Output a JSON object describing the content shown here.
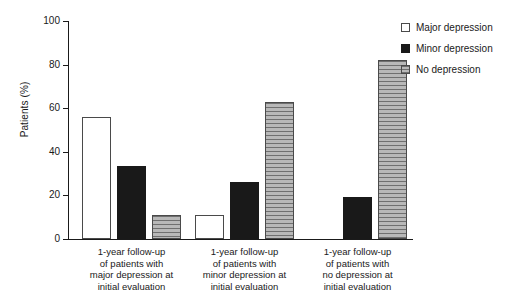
{
  "chart_data": {
    "type": "bar",
    "title": "",
    "xlabel": "",
    "ylabel": "Patients (%)",
    "ylim": [
      0,
      100
    ],
    "yticks": [
      0,
      20,
      40,
      60,
      80,
      100
    ],
    "ytick_labels": [
      "0",
      "20",
      "40",
      "60",
      "80",
      "100"
    ],
    "grid": false,
    "legend_position": "top-right",
    "categories": [
      "1-year follow-up\nof patients with\nmajor depression at\ninitial evaluation",
      "1-year follow-up\nof patients with\nminor depression at\ninitial evaluation",
      "1-year follow-up\nof patients with\nno depression at\ninitial evaluation"
    ],
    "series": [
      {
        "name": "Major depression",
        "key": "major",
        "color": "#ffffff",
        "values": [
          56,
          11,
          0
        ]
      },
      {
        "name": "Minor depression",
        "key": "minor",
        "color": "#191919",
        "values": [
          33.5,
          26,
          19.5
        ]
      },
      {
        "name": "No depression",
        "key": "none",
        "color": "#9a9a9a",
        "values": [
          11,
          63,
          82
        ]
      }
    ]
  },
  "legend": {
    "items": [
      {
        "label": "Major depression",
        "key": "major"
      },
      {
        "label": "Minor depression",
        "key": "minor"
      },
      {
        "label": "No depression",
        "key": "none"
      }
    ]
  }
}
